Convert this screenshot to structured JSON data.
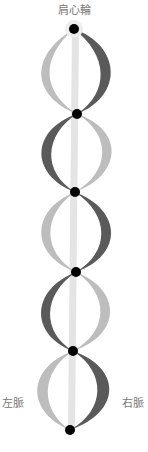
{
  "labels": {
    "top": "肩心輪",
    "left": "左脈",
    "right": "右脈"
  },
  "colors": {
    "dark_channel": "#5a5a5a",
    "light_channel": "#bdbdbd",
    "center_channel": "#e2e2e2",
    "node": "#000000"
  },
  "nodes": [
    {
      "x": 74,
      "y": 29
    },
    {
      "x": 77,
      "y": 114
    },
    {
      "x": 75,
      "y": 192
    },
    {
      "x": 76,
      "y": 272
    },
    {
      "x": 73,
      "y": 351
    },
    {
      "x": 70,
      "y": 430
    }
  ]
}
